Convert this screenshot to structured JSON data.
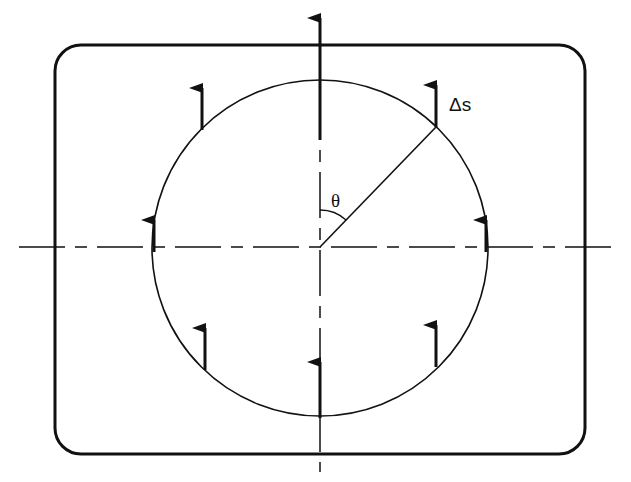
{
  "diagram": {
    "type": "geometry",
    "labels": {
      "delta_s": "Δs",
      "theta": "θ"
    },
    "colors": {
      "stroke": "#111111",
      "background": "#ffffff"
    },
    "elements": [
      {
        "kind": "rounded-rectangle",
        "x": 55,
        "y": 45,
        "w": 530,
        "h": 409,
        "r": 26
      },
      {
        "kind": "circle",
        "cx": 320,
        "cy": 248,
        "r": 168
      },
      {
        "kind": "dashed-axis",
        "orientation": "horizontal",
        "y": 247
      },
      {
        "kind": "dashed-axis",
        "orientation": "vertical",
        "x": 320
      },
      {
        "kind": "radius-line",
        "angle_label": "θ"
      },
      {
        "kind": "arrows",
        "count": 8,
        "direction": "up"
      }
    ]
  }
}
